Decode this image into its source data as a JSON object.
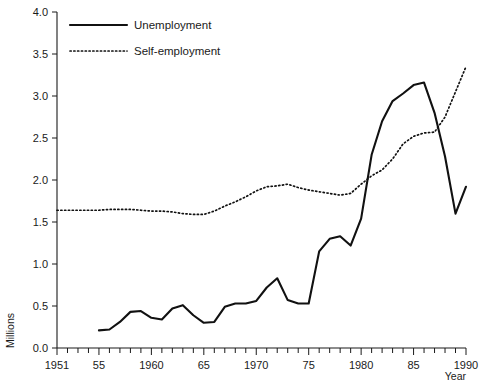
{
  "chart_data": {
    "type": "line",
    "title": "",
    "xlabel": "Year",
    "ylabel": "Millions",
    "xlim": [
      1951,
      1990
    ],
    "ylim": [
      0.0,
      4.0
    ],
    "grid": false,
    "legend_position": "top-left",
    "x_tick_labels": [
      "1951",
      "55",
      "1960",
      "65",
      "1970",
      "75",
      "1980",
      "85",
      "1990"
    ],
    "x_tick_values": [
      1951,
      1955,
      1960,
      1965,
      1970,
      1975,
      1980,
      1985,
      1990
    ],
    "x_minor_ticks_every": 1,
    "y_tick_labels": [
      "0.0",
      "0.5",
      "1.0",
      "1.5",
      "2.0",
      "2.5",
      "3.0",
      "3.5",
      "4.0"
    ],
    "y_tick_values": [
      0.0,
      0.5,
      1.0,
      1.5,
      2.0,
      2.5,
      3.0,
      3.5,
      4.0
    ],
    "series": [
      {
        "name": "Unemployment",
        "style": "solid",
        "color": "#111111",
        "x": [
          1955,
          1956,
          1957,
          1958,
          1959,
          1960,
          1961,
          1962,
          1963,
          1964,
          1965,
          1966,
          1967,
          1968,
          1969,
          1970,
          1971,
          1972,
          1973,
          1974,
          1975,
          1976,
          1977,
          1978,
          1979,
          1980,
          1981,
          1982,
          1983,
          1984,
          1985,
          1986,
          1987,
          1988,
          1989,
          1990
        ],
        "values": [
          0.21,
          0.22,
          0.31,
          0.43,
          0.44,
          0.36,
          0.34,
          0.47,
          0.51,
          0.39,
          0.3,
          0.31,
          0.49,
          0.53,
          0.53,
          0.56,
          0.72,
          0.83,
          0.57,
          0.53,
          0.53,
          1.15,
          1.3,
          1.33,
          1.22,
          1.54,
          2.3,
          2.7,
          2.94,
          3.03,
          3.13,
          3.16,
          2.8,
          2.28,
          1.6,
          1.92
        ]
      },
      {
        "name": "Self-employment",
        "style": "dotted",
        "color": "#111111",
        "x": [
          1951,
          1952,
          1953,
          1954,
          1955,
          1956,
          1957,
          1958,
          1959,
          1960,
          1961,
          1962,
          1963,
          1964,
          1965,
          1966,
          1967,
          1968,
          1969,
          1970,
          1971,
          1972,
          1973,
          1974,
          1975,
          1976,
          1977,
          1978,
          1979,
          1980,
          1981,
          1982,
          1983,
          1984,
          1985,
          1986,
          1987,
          1988,
          1989,
          1990
        ],
        "values": [
          1.64,
          1.64,
          1.64,
          1.64,
          1.64,
          1.65,
          1.65,
          1.65,
          1.64,
          1.63,
          1.63,
          1.62,
          1.6,
          1.59,
          1.59,
          1.63,
          1.69,
          1.74,
          1.8,
          1.87,
          1.92,
          1.93,
          1.95,
          1.91,
          1.88,
          1.86,
          1.84,
          1.82,
          1.84,
          1.95,
          2.05,
          2.12,
          2.25,
          2.43,
          2.52,
          2.56,
          2.57,
          2.75,
          3.05,
          3.35
        ]
      }
    ]
  },
  "legend": {
    "items": [
      {
        "label": "Unemployment",
        "style": "solid"
      },
      {
        "label": "Self-employment",
        "style": "dotted"
      }
    ]
  },
  "axes": {
    "y_title": "Millions",
    "x_title": "Year"
  }
}
